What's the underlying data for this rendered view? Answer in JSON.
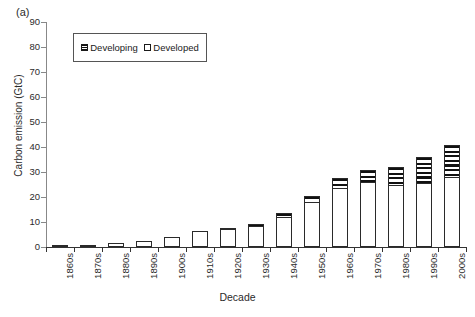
{
  "panel_label": "(a)",
  "legend": {
    "position": "top-left-inside",
    "entries": [
      {
        "label": "Developing",
        "swatch": "hatched-square-icon"
      },
      {
        "label": "Developed",
        "swatch": "open-square-icon"
      }
    ]
  },
  "chart_data": {
    "type": "bar",
    "title": "",
    "subtitle": "",
    "xlabel": "Decade",
    "ylabel": "Carbon emission (GtC)",
    "ylim": [
      0,
      90
    ],
    "ytick_values": [
      0,
      10,
      20,
      30,
      40,
      50,
      60,
      70,
      80,
      90
    ],
    "ytick_labels": [
      "0",
      "10",
      "20",
      "30",
      "40",
      "50",
      "60",
      "70",
      "80",
      "90"
    ],
    "grid": false,
    "stacked": true,
    "stack_order": [
      "Developed",
      "Developing"
    ],
    "categories": [
      "1860s",
      "1870s",
      "1880s",
      "1890s",
      "1900s",
      "1910s",
      "1920s",
      "1930s",
      "1940s",
      "1950s",
      "1960s",
      "1970s",
      "1980s",
      "1990s",
      "2000s"
    ],
    "series": [
      {
        "name": "Developed",
        "color": "#ffffff",
        "pattern": "solid-open",
        "values": [
          0.6,
          0.9,
          1.6,
          2.6,
          4.1,
          6.6,
          7.4,
          8.6,
          12.2,
          18.0,
          23.5,
          26.0,
          25.0,
          25.5,
          28.0
        ]
      },
      {
        "name": "Developing",
        "color": "#111111",
        "pattern": "horizontal-hatch",
        "values": [
          0.0,
          0.0,
          0.0,
          0.0,
          0.0,
          0.0,
          0.2,
          0.8,
          1.6,
          2.5,
          4.3,
          5.0,
          7.0,
          10.5,
          13.0
        ]
      }
    ],
    "totals": [
      0.6,
      0.9,
      1.6,
      2.6,
      4.1,
      6.6,
      7.6,
      9.4,
      13.8,
      20.5,
      27.8,
      31.0,
      32.0,
      36.0,
      41.0
    ]
  }
}
